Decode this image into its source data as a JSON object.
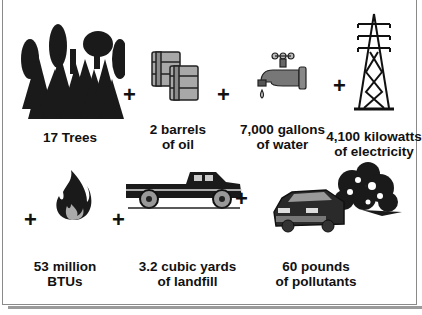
{
  "infographic": {
    "items": [
      {
        "id": "trees",
        "label": "17 Trees",
        "icon": "forest-icon"
      },
      {
        "id": "oil",
        "label": "2 barrels\nof oil",
        "icon": "oil-barrels-icon"
      },
      {
        "id": "water",
        "label": "7,000 gallons\nof water",
        "icon": "water-faucet-icon"
      },
      {
        "id": "electricity",
        "label": "4,100 kilowatts\nof electricity",
        "icon": "power-tower-icon"
      },
      {
        "id": "energy",
        "label": "53 million\nBTUs",
        "icon": "flame-icon"
      },
      {
        "id": "landfill",
        "label": "3.2 cubic yards\nof landfill",
        "icon": "pickup-truck-icon"
      },
      {
        "id": "pollutants",
        "label": "60 pounds\nof pollutants",
        "icon": "car-exhaust-icon"
      }
    ],
    "operator": "+"
  }
}
